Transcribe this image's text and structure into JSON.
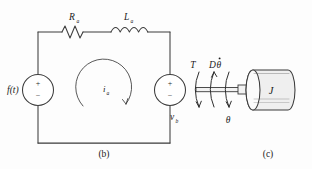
{
  "figure": {
    "background_color": "#fdfdfd",
    "line_color": "#3d3d3d",
    "text_color": "#1b1b1b"
  },
  "panel_b": {
    "caption": "(b)",
    "description": "Series RL armature loop with source f(t) and back-emf source v_b",
    "components": {
      "resistor": {
        "symbol": "R",
        "subscript": "a",
        "label": "Ra"
      },
      "inductor": {
        "symbol": "L",
        "subscript": "a",
        "label": "La"
      },
      "source_left": {
        "label": "f(t)",
        "plus": "+",
        "minus": "−"
      },
      "source_right": {
        "symbol": "v",
        "subscript": "b",
        "label": "vb",
        "plus": "+",
        "minus": "−"
      },
      "loop_current": {
        "symbol": "i",
        "subscript": "a",
        "label": "ia",
        "direction": "clockwise"
      }
    }
  },
  "panel_c": {
    "caption": "(c)",
    "description": "Rotating shaft with inertia J, damping torque and applied torque",
    "labels": {
      "torque": "T",
      "damping": "Dθ̇",
      "damping_symbol": "D",
      "damping_theta": "θ",
      "angle": "θ",
      "inertia": "J"
    }
  }
}
